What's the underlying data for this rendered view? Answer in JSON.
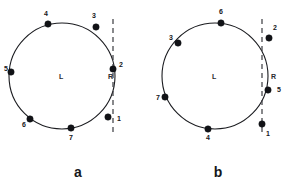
{
  "figure": {
    "background_color": "#ffffff",
    "stroke_color": "#1b1c20",
    "dash_color": "#3a3b40",
    "dot_color": "#111216",
    "panels": [
      {
        "id": "panel-a",
        "caption": "a",
        "caption_x": 78,
        "caption_y": 177,
        "circle": {
          "cx": 62,
          "cy": 76,
          "r": 53
        },
        "region_left": {
          "label": "L",
          "x": 59,
          "y": 79
        },
        "region_right": {
          "label": "R",
          "x": 108,
          "y": 79
        },
        "chord": {
          "x": 113,
          "y_top": 19,
          "y_bottom": 133
        },
        "points": [
          {
            "label": "1",
            "cx": 108,
            "cy": 117,
            "lx": 117,
            "ly": 121
          },
          {
            "label": "2",
            "cx": 113,
            "cy": 69,
            "lx": 119,
            "ly": 67
          },
          {
            "label": "3",
            "cx": 96,
            "cy": 27,
            "lx": 92,
            "ly": 18
          },
          {
            "label": "4",
            "cx": 48,
            "cy": 24,
            "lx": 44,
            "ly": 16
          },
          {
            "label": "5",
            "cx": 11,
            "cy": 72,
            "lx": 4,
            "ly": 71
          },
          {
            "label": "6",
            "cx": 30,
            "cy": 119,
            "lx": 22,
            "ly": 127
          },
          {
            "label": "7",
            "cx": 71,
            "cy": 128,
            "lx": 69,
            "ly": 140
          }
        ]
      },
      {
        "id": "panel-b",
        "caption": "b",
        "caption_x": 218,
        "caption_y": 177,
        "circle": {
          "cx": 215,
          "cy": 76,
          "r": 53
        },
        "region_left": {
          "label": "L",
          "x": 212,
          "y": 79
        },
        "region_right": {
          "label": "R",
          "x": 271,
          "y": 79
        },
        "chord": {
          "x": 262,
          "y_top": 19,
          "y_bottom": 133
        },
        "points": [
          {
            "label": "1",
            "cx": 262,
            "cy": 124,
            "lx": 266,
            "ly": 136
          },
          {
            "label": "2",
            "cx": 269,
            "cy": 38,
            "lx": 273,
            "ly": 30
          },
          {
            "label": "3",
            "cx": 178,
            "cy": 43,
            "lx": 169,
            "ly": 40
          },
          {
            "label": "4",
            "cx": 208,
            "cy": 129,
            "lx": 206,
            "ly": 140
          },
          {
            "label": "5",
            "cx": 268,
            "cy": 90,
            "lx": 277,
            "ly": 92
          },
          {
            "label": "6",
            "cx": 221,
            "cy": 23,
            "lx": 219,
            "ly": 14
          },
          {
            "label": "7",
            "cx": 165,
            "cy": 97,
            "lx": 156,
            "ly": 100
          }
        ]
      }
    ]
  }
}
